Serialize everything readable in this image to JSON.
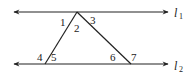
{
  "diagram": {
    "lines": [
      {
        "id": "l1",
        "label": "l",
        "subscript": "1"
      },
      {
        "id": "l2",
        "label": "l",
        "subscript": "2"
      }
    ],
    "angles": [
      "1",
      "2",
      "3",
      "4",
      "5",
      "6",
      "7"
    ]
  }
}
